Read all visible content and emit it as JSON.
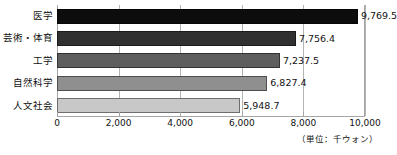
{
  "chart_data": {
    "type": "bar",
    "orientation": "horizontal",
    "title": "",
    "xlabel": "",
    "ylabel": "",
    "categories": [
      "医学",
      "芸術・体育",
      "工学",
      "自然科学",
      "人文社会"
    ],
    "values": [
      9769.5,
      7756.4,
      7237.5,
      6827.4,
      5948.7
    ],
    "value_labels": [
      "9,769.5",
      "7,756.4",
      "7,237.5",
      "6,827.4",
      "5,948.7"
    ],
    "bar_colors": [
      "#0d0d0d",
      "#303030",
      "#5e5e5e",
      "#8f8f8f",
      "#c8c8c8"
    ],
    "xlim": [
      0,
      10000
    ],
    "xticks": [
      0,
      2000,
      4000,
      6000,
      8000,
      10000
    ],
    "xtick_labels": [
      "0",
      "2,000",
      "4,000",
      "6,000",
      "8,000",
      "10,000"
    ],
    "grid": true,
    "grid_axis": "x",
    "legend": "none",
    "unit_note": "（単位：千ウォン）"
  }
}
